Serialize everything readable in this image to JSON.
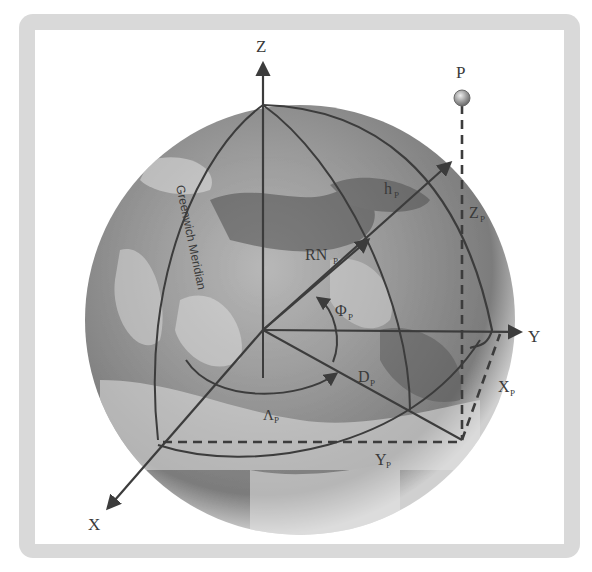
{
  "diagram": {
    "type": "geocentric-coordinate-system",
    "frame": {
      "border_color": "#d8d8d8",
      "background": "#ffffff"
    },
    "colors": {
      "line": "#3c3c3c",
      "globe_dark": "#5a5a5a",
      "globe_light": "#c8c8c8",
      "point": "#a0a0a0"
    },
    "axes": {
      "z": {
        "label": "Z"
      },
      "y": {
        "label": "Y"
      },
      "x": {
        "label": "X"
      }
    },
    "point": {
      "label": "P"
    },
    "labels": {
      "h": {
        "main": "h",
        "sub": "P"
      },
      "rn": {
        "main": "RN",
        "sub": "P"
      },
      "phi": {
        "main": "Φ",
        "sub": "P"
      },
      "d": {
        "main": "D",
        "sub": "P"
      },
      "lambda": {
        "main": "Λ",
        "sub": "P"
      },
      "zp": {
        "main": "Z",
        "sub": "P"
      },
      "xp": {
        "main": "X",
        "sub": "P"
      },
      "yp": {
        "main": "Y",
        "sub": "P"
      }
    },
    "meridian_label": "Greenwich Meridian"
  }
}
